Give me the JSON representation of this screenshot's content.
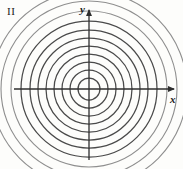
{
  "figure": {
    "title_label": "II",
    "background_color": "#fdfdfb",
    "ink_color": "#3a3a3a",
    "faint_ink_color": "#9a9a9a",
    "width": 183,
    "height": 169
  },
  "axes": {
    "origin": {
      "x": 89,
      "y": 89
    },
    "x_axis": {
      "label": "x",
      "label_x": 170,
      "label_y": 94,
      "start_x": 14,
      "end_x": 176,
      "y": 89,
      "arrow": "right"
    },
    "y_axis": {
      "label": "y",
      "label_x": 80,
      "label_y": 4,
      "x": 89,
      "start_y": 160,
      "end_y": 8,
      "arrow": "up"
    }
  },
  "quadrant": {
    "name": "II",
    "x": 7,
    "y": 6
  },
  "chart_data": {
    "type": "contour",
    "title": "",
    "xlabel": "x",
    "ylabel": "y",
    "center": {
      "x": 89,
      "y": 89
    },
    "full_circle_radii": [
      11,
      19,
      27,
      35,
      43,
      51,
      59,
      68
    ],
    "partial_arc_radii": [
      78,
      88,
      98
    ],
    "circle_count": 8,
    "partial_arc_count": 3,
    "grid": false,
    "legend": null
  }
}
